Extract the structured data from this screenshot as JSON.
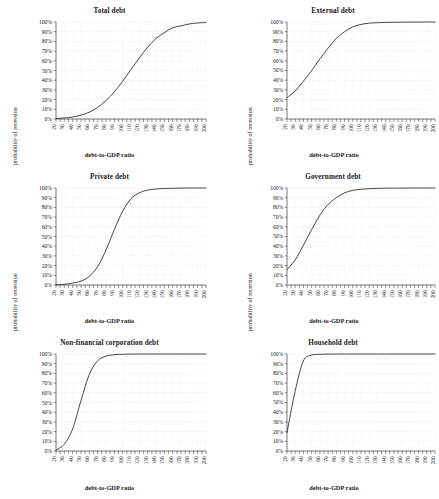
{
  "figure": {
    "axis_titles": {
      "x": "debt-to-GDP ratio",
      "y": "probability of recession"
    },
    "y_ticks": [
      "0%",
      "10%",
      "20%",
      "30%",
      "40%",
      "50%",
      "60%",
      "70%",
      "80%",
      "90%",
      "100%"
    ],
    "x_ticks": [
      "20",
      "30",
      "40",
      "50",
      "60",
      "70",
      "80",
      "90",
      "100",
      "110",
      "120",
      "130",
      "140",
      "150",
      "160",
      "170",
      "180",
      "190",
      "200"
    ],
    "line_color": "#262626",
    "grid_color": "#c9c9c9",
    "axis_color": "#2b2b2b",
    "background": "#ffffff"
  },
  "chart_data": [
    {
      "type": "line",
      "title": "Total debt",
      "xlabel": "debt-to-GDP ratio",
      "ylabel": "probability of recession",
      "xlim": [
        20,
        200
      ],
      "ylim": [
        0,
        100
      ],
      "grid": true,
      "legend": "none",
      "x": [
        20,
        30,
        40,
        50,
        60,
        70,
        80,
        90,
        100,
        110,
        120,
        130,
        140,
        150,
        160,
        170,
        180,
        190,
        200
      ],
      "y": [
        0.5,
        1,
        2,
        4,
        7,
        12,
        19,
        28,
        39,
        51,
        63,
        74,
        83,
        89,
        94,
        96,
        98,
        99,
        99.5
      ],
      "series_name": "probability of recession"
    },
    {
      "type": "line",
      "title": "External debt",
      "xlabel": "debt-to-GDP ratio",
      "ylabel": "probability of recession",
      "xlim": [
        20,
        200
      ],
      "ylim": [
        0,
        100
      ],
      "grid": true,
      "legend": "none",
      "x": [
        20,
        30,
        40,
        50,
        60,
        70,
        80,
        90,
        100,
        110,
        120,
        130,
        140,
        150,
        160,
        170,
        180,
        190,
        200
      ],
      "y": [
        22,
        29,
        39,
        50,
        62,
        73,
        83,
        90,
        95,
        97.5,
        98.8,
        99.3,
        99.6,
        99.7,
        99.8,
        99.9,
        99.9,
        100,
        100
      ],
      "series_name": "probability of recession"
    },
    {
      "type": "line",
      "title": "Private debt",
      "xlabel": "debt-to-GDP ratio",
      "ylabel": "probability of recession",
      "xlim": [
        20,
        200
      ],
      "ylim": [
        0,
        100
      ],
      "grid": true,
      "legend": "none",
      "x": [
        20,
        30,
        40,
        50,
        60,
        70,
        80,
        90,
        100,
        110,
        120,
        130,
        140,
        150,
        160,
        170,
        180,
        190,
        200
      ],
      "y": [
        0.3,
        0.8,
        2,
        4,
        9,
        19,
        36,
        57,
        76,
        89,
        95,
        97.8,
        99,
        99.5,
        99.7,
        99.9,
        100,
        100,
        100
      ],
      "series_name": "probability of recession"
    },
    {
      "type": "line",
      "title": "Government debt",
      "xlabel": "debt-to-GDP ratio",
      "ylabel": "probability of recession",
      "xlim": [
        20,
        200
      ],
      "ylim": [
        0,
        100
      ],
      "grid": true,
      "legend": "none",
      "x": [
        20,
        30,
        40,
        50,
        60,
        70,
        80,
        90,
        100,
        110,
        120,
        130,
        140,
        150,
        160,
        170,
        180,
        190,
        200
      ],
      "y": [
        16,
        26,
        41,
        57,
        72,
        83,
        90,
        95,
        97.5,
        98.7,
        99.3,
        99.6,
        99.8,
        99.9,
        99.9,
        100,
        100,
        100,
        100
      ],
      "series_name": "probability of recession"
    },
    {
      "type": "line",
      "title": "Non-financial corporation debt",
      "xlabel": "debt-to-GDP ratio",
      "ylabel": "probability of recession",
      "xlim": [
        20,
        200
      ],
      "ylim": [
        0,
        100
      ],
      "grid": true,
      "legend": "none",
      "x": [
        20,
        30,
        40,
        50,
        60,
        70,
        80,
        90,
        100,
        110,
        120,
        130,
        140,
        150,
        160,
        170,
        180,
        190,
        200
      ],
      "y": [
        1,
        7,
        23,
        52,
        79,
        93,
        97.8,
        99.3,
        99.7,
        99.9,
        100,
        100,
        100,
        100,
        100,
        100,
        100,
        100,
        100
      ],
      "series_name": "probability of recession"
    },
    {
      "type": "line",
      "title": "Household debt",
      "xlabel": "debt-to-GDP ratio",
      "ylabel": "probability of recession",
      "xlim": [
        20,
        200
      ],
      "ylim": [
        0,
        100
      ],
      "grid": true,
      "legend": "none",
      "x": [
        20,
        30,
        40,
        50,
        60,
        70,
        80,
        90,
        100,
        110,
        120,
        130,
        140,
        150,
        160,
        170,
        180,
        190,
        200
      ],
      "y": [
        19,
        62,
        93,
        98.8,
        99.7,
        99.9,
        100,
        100,
        100,
        100,
        100,
        100,
        100,
        100,
        100,
        100,
        100,
        100,
        100
      ],
      "series_name": "probability of recession"
    }
  ]
}
